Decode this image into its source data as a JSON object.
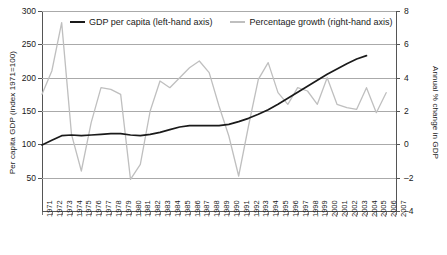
{
  "chart_data": {
    "type": "line",
    "title": "",
    "xlabel": "",
    "ylabel": "Per capita GDP (index 1971=100)",
    "y2label": "Annual % change in GDP",
    "grid": true,
    "legend_position": "top-inside",
    "x": [
      1971,
      1972,
      1973,
      1974,
      1975,
      1976,
      1977,
      1978,
      1979,
      1980,
      1981,
      1982,
      1983,
      1984,
      1985,
      1986,
      1987,
      1988,
      1989,
      1990,
      1991,
      1992,
      1993,
      1994,
      1995,
      1996,
      1997,
      1998,
      1999,
      2000,
      2001,
      2002,
      2003,
      2004,
      2005,
      2006,
      2007
    ],
    "xtick_labels": [
      "1971",
      "1972",
      "1973",
      "1974",
      "1975",
      "1976",
      "1977",
      "1978",
      "1979",
      "1980",
      "1981",
      "1982",
      "1983",
      "1984",
      "1985",
      "1986",
      "1987",
      "1988",
      "1989",
      "1990",
      "1991",
      "1992",
      "1993",
      "1994",
      "1995",
      "1996",
      "1997",
      "1998",
      "1999",
      "2000",
      "2001",
      "2002",
      "2003",
      "2004",
      "2005",
      "2006",
      "2007"
    ],
    "ylim": [
      0,
      300
    ],
    "yticks": [
      50,
      100,
      150,
      200,
      250,
      300
    ],
    "ytick_labels": [
      "50",
      "100",
      "150",
      "200",
      "250",
      "300"
    ],
    "y2lim": [
      -4,
      8
    ],
    "y2ticks": [
      -4,
      -2,
      0,
      2,
      4,
      6,
      8
    ],
    "y2tick_labels": [
      "–4",
      "–2",
      "0",
      "2",
      "4",
      "6",
      "8"
    ],
    "series": [
      {
        "name": "GDP per capita (left-hand axis)",
        "axis": "left",
        "color": "#1a1a1a",
        "x": [
          1971,
          1972,
          1973,
          1974,
          1975,
          1976,
          1977,
          1978,
          1979,
          1980,
          1981,
          1982,
          1983,
          1984,
          1985,
          1986,
          1987,
          1988,
          1989,
          1990,
          1991,
          1992,
          1993,
          1994,
          1995,
          1996,
          1997,
          1998,
          1999,
          2000,
          2001,
          2002,
          2003,
          2004
        ],
        "values": [
          99,
          106,
          113,
          114,
          113,
          114,
          115,
          116,
          116,
          114,
          113,
          115,
          118,
          122,
          126,
          128,
          128,
          128,
          128,
          130,
          134,
          139,
          145,
          152,
          160,
          169,
          178,
          187,
          196,
          205,
          213,
          221,
          228,
          233
        ]
      },
      {
        "name": "Percentage growth (right-hand axis)",
        "axis": "right",
        "color": "#bfbfbf",
        "x": [
          1971,
          1972,
          1973,
          1974,
          1975,
          1976,
          1977,
          1978,
          1979,
          1980,
          1981,
          1982,
          1983,
          1984,
          1985,
          1986,
          1987,
          1988,
          1989,
          1990,
          1991,
          1992,
          1993,
          1994,
          1995,
          1996,
          1997,
          1998,
          1999,
          2000,
          2001,
          2002,
          2003,
          2004,
          2005,
          2006
        ],
        "values": [
          3.0,
          4.4,
          7.3,
          0.6,
          -1.6,
          1.3,
          3.4,
          3.3,
          3.0,
          -2.1,
          -1.2,
          2.0,
          3.8,
          3.4,
          4.0,
          4.6,
          5.0,
          4.3,
          2.3,
          0.5,
          -1.9,
          1.1,
          3.9,
          4.9,
          3.1,
          2.4,
          3.4,
          3.2,
          2.4,
          4.0,
          2.4,
          2.2,
          2.1,
          3.4,
          1.9,
          3.1
        ]
      }
    ]
  },
  "legend": {
    "entries": [
      {
        "label": "GDP per capita (left-hand axis)"
      },
      {
        "label": "Percentage growth (right-hand axis)"
      }
    ]
  }
}
